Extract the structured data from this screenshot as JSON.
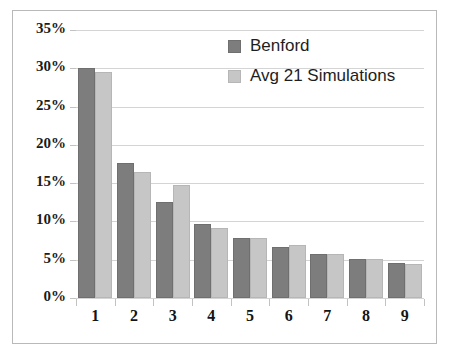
{
  "chart_data": {
    "type": "bar",
    "title": "",
    "subtitle": "",
    "xlabel": "",
    "ylabel": "",
    "categories": [
      "1",
      "2",
      "3",
      "4",
      "5",
      "6",
      "7",
      "8",
      "9"
    ],
    "series": [
      {
        "name": "Benford",
        "color": "#7d7d7d",
        "values": [
          30.1,
          17.6,
          12.5,
          9.7,
          7.9,
          6.7,
          5.7,
          5.1,
          4.6
        ]
      },
      {
        "name": "Avg 21 Simulations",
        "color": "#c6c6c6",
        "values": [
          29.5,
          16.5,
          14.8,
          9.1,
          7.9,
          6.9,
          5.7,
          5.1,
          4.4
        ]
      }
    ],
    "ylim": [
      0,
      35
    ],
    "ytick_values": [
      0,
      5,
      10,
      15,
      20,
      25,
      30,
      35
    ],
    "ytick_labels": [
      "0%",
      "5%",
      "10%",
      "15%",
      "20%",
      "25%",
      "30%",
      "35%"
    ],
    "grid": true,
    "grid_axis": "y",
    "legend_position": "upper-right",
    "legend": [
      "Benford",
      "Avg 21 Simulations"
    ],
    "annotations": []
  },
  "figure": {
    "background_color": "#ffffff",
    "border_color": "#b9b9b9",
    "gridline_color": "#d4d4d4",
    "axis_color": "#c9c9c9"
  }
}
